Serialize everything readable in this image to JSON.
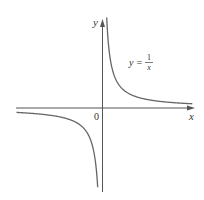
{
  "chart_data": {
    "type": "line",
    "title": "",
    "function": "y = 1/x",
    "annotation": {
      "prefix": "y =",
      "numerator": "1",
      "denominator": "x"
    },
    "xlabel": "x",
    "ylabel": "y",
    "origin_label": "0",
    "grid": false,
    "legend": "none",
    "xlim": [
      -4.5,
      4.5
    ],
    "ylim": [
      -4.5,
      4.5
    ],
    "series": [
      {
        "name": "y = 1/x (x > 0)",
        "x": [
          0.22,
          0.3,
          0.4,
          0.5,
          0.75,
          1,
          1.5,
          2,
          3,
          4
        ],
        "y": [
          4.5,
          3.33,
          2.5,
          2,
          1.33,
          1,
          0.67,
          0.5,
          0.33,
          0.25
        ]
      },
      {
        "name": "y = 1/x (x < 0)",
        "x": [
          -4,
          -3,
          -2,
          -1.5,
          -1,
          -0.75,
          -0.5,
          -0.4,
          -0.3,
          -0.22
        ],
        "y": [
          -0.25,
          -0.33,
          -0.5,
          -0.67,
          -1,
          -1.33,
          -2,
          -2.5,
          -3.33,
          -4.5
        ]
      }
    ],
    "colors": {
      "axis": "#555555",
      "curve": "#666666"
    }
  }
}
